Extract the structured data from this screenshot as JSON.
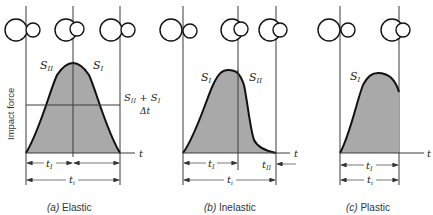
{
  "y_axis_label": "Impact force",
  "time_symbol": "t",
  "panels": [
    {
      "id": "a",
      "caption_letter": "(a)",
      "caption": "Elastic",
      "labels": {
        "left_area": "S",
        "left_sub": "II",
        "right_area": "S",
        "right_sub": "I",
        "avg_num_s1": "S",
        "avg_num_s1_sub": "II",
        "avg_plus": "+",
        "avg_num_s2": "S",
        "avg_num_s2_sub": "I",
        "avg_den": "Δt",
        "t1": "t",
        "t1_sub": "I",
        "ti": "t",
        "ti_sub": "i"
      }
    },
    {
      "id": "b",
      "caption_letter": "(b)",
      "caption": "Inelastic",
      "labels": {
        "left_area": "S",
        "left_sub": "I",
        "right_area": "S",
        "right_sub": "II",
        "t1": "t",
        "t1_sub": "I",
        "t2": "t",
        "t2_sub": "II",
        "ti": "t",
        "ti_sub": "i"
      }
    },
    {
      "id": "c",
      "caption_letter": "(c)",
      "caption": "Plastic",
      "labels": {
        "left_area": "S",
        "left_sub": "I",
        "t1": "t",
        "t1_sub": "I",
        "ti": "t",
        "ti_sub": "i"
      }
    }
  ],
  "colors": {
    "fill": "#a9a9a9",
    "curve": "#111111",
    "line": "#3a3a3a"
  }
}
